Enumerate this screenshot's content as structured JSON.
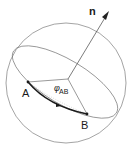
{
  "diagram": {
    "labels": {
      "normal": "n",
      "point_a": "A",
      "point_b": "B",
      "angle_symbol": "φ",
      "angle_subscript": "AB"
    },
    "colors": {
      "stroke": "#555555",
      "arc": "#1a1a1a",
      "background": "#ffffff"
    }
  }
}
